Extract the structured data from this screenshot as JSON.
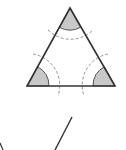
{
  "diagram": {
    "colors": {
      "stroke": "#333333",
      "sector_fill": "#c8c8c8",
      "dashed_arc": "#888888",
      "background": "#ffffff"
    },
    "triangle": {
      "apex": [
        70,
        8
      ],
      "base_left": [
        27,
        86
      ],
      "base_right": [
        115,
        86
      ]
    },
    "sector_radius": 22,
    "dashed_arc_radius": 32,
    "lower_line": {
      "from": [
        72,
        117
      ],
      "to": [
        55,
        150
      ]
    },
    "corner_stroke": {
      "from": [
        0,
        143
      ],
      "to": [
        3,
        150
      ]
    }
  }
}
